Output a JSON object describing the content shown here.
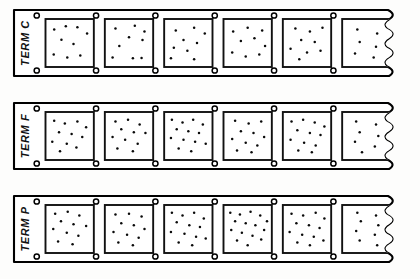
{
  "diagram": {
    "background_color": "#fdfdfc",
    "ink_color": "#111111",
    "dot_color": "#0a0a0a",
    "strip_fill": "#ffffff",
    "break_style": "wavy-break-line",
    "strips": [
      {
        "id": "strip-term-c",
        "label": "TERM C",
        "y": 10,
        "height": 66,
        "x": 14,
        "width": 392,
        "cell_count": 5,
        "partial_cell": true,
        "hole_count_top": 6,
        "hole_count_bottom": 6,
        "cells": [
          {
            "index": 1,
            "dot_count": 9,
            "dots": [
              [
                0.18,
                0.22
              ],
              [
                0.42,
                0.15
              ],
              [
                0.66,
                0.17
              ],
              [
                0.86,
                0.3
              ],
              [
                0.33,
                0.43
              ],
              [
                0.58,
                0.52
              ],
              [
                0.17,
                0.74
              ],
              [
                0.45,
                0.8
              ],
              [
                0.72,
                0.76
              ]
            ]
          },
          {
            "index": 2,
            "dot_count": 9,
            "dots": [
              [
                0.22,
                0.2
              ],
              [
                0.62,
                0.14
              ],
              [
                0.82,
                0.26
              ],
              [
                0.5,
                0.38
              ],
              [
                0.78,
                0.44
              ],
              [
                0.3,
                0.56
              ],
              [
                0.16,
                0.8
              ],
              [
                0.58,
                0.82
              ],
              [
                0.76,
                0.81
              ]
            ]
          },
          {
            "index": 3,
            "dot_count": 9,
            "dots": [
              [
                0.24,
                0.24
              ],
              [
                0.62,
                0.18
              ],
              [
                0.84,
                0.3
              ],
              [
                0.4,
                0.44
              ],
              [
                0.68,
                0.5
              ],
              [
                0.2,
                0.6
              ],
              [
                0.48,
                0.66
              ],
              [
                0.14,
                0.82
              ],
              [
                0.62,
                0.84
              ]
            ]
          },
          {
            "index": 4,
            "dot_count": 9,
            "dots": [
              [
                0.2,
                0.26
              ],
              [
                0.5,
                0.18
              ],
              [
                0.8,
                0.24
              ],
              [
                0.36,
                0.46
              ],
              [
                0.64,
                0.4
              ],
              [
                0.86,
                0.56
              ],
              [
                0.18,
                0.7
              ],
              [
                0.46,
                0.78
              ],
              [
                0.74,
                0.74
              ]
            ]
          },
          {
            "index": 5,
            "dot_count": 9,
            "dots": [
              [
                0.26,
                0.2
              ],
              [
                0.56,
                0.26
              ],
              [
                0.82,
                0.18
              ],
              [
                0.38,
                0.44
              ],
              [
                0.66,
                0.48
              ],
              [
                0.16,
                0.62
              ],
              [
                0.5,
                0.7
              ],
              [
                0.78,
                0.66
              ],
              [
                0.34,
                0.84
              ]
            ]
          },
          {
            "index": 6,
            "partial": true,
            "dot_count": 6,
            "dots": [
              [
                0.26,
                0.22
              ],
              [
                0.6,
                0.3
              ],
              [
                0.3,
                0.48
              ],
              [
                0.58,
                0.58
              ],
              [
                0.22,
                0.72
              ],
              [
                0.54,
                0.8
              ]
            ]
          }
        ]
      },
      {
        "id": "strip-term-f",
        "label": "TERM F",
        "y": 103,
        "height": 66,
        "x": 14,
        "width": 392,
        "cell_count": 5,
        "partial_cell": true,
        "hole_count_top": 6,
        "hole_count_bottom": 6,
        "cells": [
          {
            "index": 1,
            "dot_count": 11,
            "dots": [
              [
                0.18,
                0.18
              ],
              [
                0.4,
                0.24
              ],
              [
                0.66,
                0.2
              ],
              [
                0.84,
                0.32
              ],
              [
                0.28,
                0.42
              ],
              [
                0.54,
                0.46
              ],
              [
                0.76,
                0.52
              ],
              [
                0.14,
                0.62
              ],
              [
                0.44,
                0.66
              ],
              [
                0.64,
                0.74
              ],
              [
                0.3,
                0.82
              ]
            ]
          },
          {
            "index": 2,
            "dot_count": 11,
            "dots": [
              [
                0.22,
                0.2
              ],
              [
                0.48,
                0.16
              ],
              [
                0.72,
                0.26
              ],
              [
                0.34,
                0.36
              ],
              [
                0.6,
                0.42
              ],
              [
                0.84,
                0.44
              ],
              [
                0.16,
                0.52
              ],
              [
                0.42,
                0.58
              ],
              [
                0.68,
                0.66
              ],
              [
                0.26,
                0.76
              ],
              [
                0.58,
                0.82
              ]
            ]
          },
          {
            "index": 3,
            "dot_count": 13,
            "dots": [
              [
                0.16,
                0.16
              ],
              [
                0.38,
                0.22
              ],
              [
                0.6,
                0.16
              ],
              [
                0.8,
                0.26
              ],
              [
                0.26,
                0.36
              ],
              [
                0.5,
                0.4
              ],
              [
                0.72,
                0.44
              ],
              [
                0.14,
                0.54
              ],
              [
                0.4,
                0.58
              ],
              [
                0.64,
                0.62
              ],
              [
                0.86,
                0.66
              ],
              [
                0.3,
                0.76
              ],
              [
                0.56,
                0.82
              ]
            ]
          },
          {
            "index": 4,
            "dot_count": 11,
            "dots": [
              [
                0.24,
                0.18
              ],
              [
                0.52,
                0.24
              ],
              [
                0.78,
                0.2
              ],
              [
                0.36,
                0.4
              ],
              [
                0.62,
                0.44
              ],
              [
                0.84,
                0.52
              ],
              [
                0.18,
                0.56
              ],
              [
                0.46,
                0.64
              ],
              [
                0.7,
                0.7
              ],
              [
                0.28,
                0.8
              ],
              [
                0.58,
                0.84
              ]
            ]
          },
          {
            "index": 5,
            "dot_count": 12,
            "dots": [
              [
                0.18,
                0.2
              ],
              [
                0.42,
                0.16
              ],
              [
                0.66,
                0.22
              ],
              [
                0.86,
                0.3
              ],
              [
                0.3,
                0.38
              ],
              [
                0.56,
                0.44
              ],
              [
                0.78,
                0.48
              ],
              [
                0.16,
                0.58
              ],
              [
                0.44,
                0.64
              ],
              [
                0.68,
                0.7
              ],
              [
                0.32,
                0.8
              ],
              [
                0.6,
                0.84
              ]
            ]
          },
          {
            "index": 6,
            "partial": true,
            "dot_count": 7,
            "dots": [
              [
                0.24,
                0.2
              ],
              [
                0.58,
                0.26
              ],
              [
                0.3,
                0.42
              ],
              [
                0.62,
                0.5
              ],
              [
                0.22,
                0.62
              ],
              [
                0.56,
                0.72
              ],
              [
                0.34,
                0.84
              ]
            ]
          }
        ]
      },
      {
        "id": "strip-term-p",
        "label": "TERM P",
        "y": 196,
        "height": 66,
        "x": 14,
        "width": 392,
        "cell_count": 5,
        "partial_cell": true,
        "hole_count_top": 6,
        "hole_count_bottom": 6,
        "cells": [
          {
            "index": 1,
            "dot_count": 11,
            "dots": [
              [
                0.2,
                0.18
              ],
              [
                0.46,
                0.14
              ],
              [
                0.7,
                0.22
              ],
              [
                0.32,
                0.34
              ],
              [
                0.58,
                0.4
              ],
              [
                0.84,
                0.44
              ],
              [
                0.16,
                0.5
              ],
              [
                0.44,
                0.58
              ],
              [
                0.68,
                0.64
              ],
              [
                0.26,
                0.76
              ],
              [
                0.56,
                0.82
              ]
            ]
          },
          {
            "index": 2,
            "dot_count": 11,
            "dots": [
              [
                0.22,
                0.2
              ],
              [
                0.5,
                0.18
              ],
              [
                0.76,
                0.24
              ],
              [
                0.34,
                0.38
              ],
              [
                0.6,
                0.42
              ],
              [
                0.82,
                0.5
              ],
              [
                0.18,
                0.56
              ],
              [
                0.46,
                0.62
              ],
              [
                0.7,
                0.68
              ],
              [
                0.28,
                0.78
              ],
              [
                0.58,
                0.84
              ]
            ]
          },
          {
            "index": 3,
            "dot_count": 13,
            "dots": [
              [
                0.16,
                0.16
              ],
              [
                0.38,
                0.22
              ],
              [
                0.62,
                0.16
              ],
              [
                0.82,
                0.28
              ],
              [
                0.26,
                0.36
              ],
              [
                0.52,
                0.42
              ],
              [
                0.74,
                0.46
              ],
              [
                0.14,
                0.56
              ],
              [
                0.42,
                0.6
              ],
              [
                0.66,
                0.66
              ],
              [
                0.86,
                0.7
              ],
              [
                0.3,
                0.78
              ],
              [
                0.58,
                0.84
              ]
            ]
          },
          {
            "index": 4,
            "dot_count": 15,
            "dots": [
              [
                0.14,
                0.16
              ],
              [
                0.34,
                0.2
              ],
              [
                0.56,
                0.14
              ],
              [
                0.76,
                0.22
              ],
              [
                0.9,
                0.34
              ],
              [
                0.24,
                0.34
              ],
              [
                0.46,
                0.38
              ],
              [
                0.66,
                0.42
              ],
              [
                0.84,
                0.52
              ],
              [
                0.16,
                0.52
              ],
              [
                0.38,
                0.58
              ],
              [
                0.6,
                0.64
              ],
              [
                0.78,
                0.72
              ],
              [
                0.28,
                0.74
              ],
              [
                0.5,
                0.84
              ]
            ]
          },
          {
            "index": 5,
            "dot_count": 13,
            "dots": [
              [
                0.18,
                0.18
              ],
              [
                0.42,
                0.22
              ],
              [
                0.68,
                0.16
              ],
              [
                0.86,
                0.28
              ],
              [
                0.28,
                0.38
              ],
              [
                0.54,
                0.42
              ],
              [
                0.76,
                0.48
              ],
              [
                0.14,
                0.56
              ],
              [
                0.4,
                0.62
              ],
              [
                0.64,
                0.66
              ],
              [
                0.84,
                0.74
              ],
              [
                0.3,
                0.78
              ],
              [
                0.56,
                0.84
              ]
            ]
          },
          {
            "index": 6,
            "partial": true,
            "dot_count": 8,
            "dots": [
              [
                0.26,
                0.16
              ],
              [
                0.58,
                0.22
              ],
              [
                0.32,
                0.34
              ],
              [
                0.62,
                0.42
              ],
              [
                0.24,
                0.54
              ],
              [
                0.56,
                0.62
              ],
              [
                0.3,
                0.74
              ],
              [
                0.6,
                0.84
              ]
            ]
          }
        ]
      }
    ]
  }
}
